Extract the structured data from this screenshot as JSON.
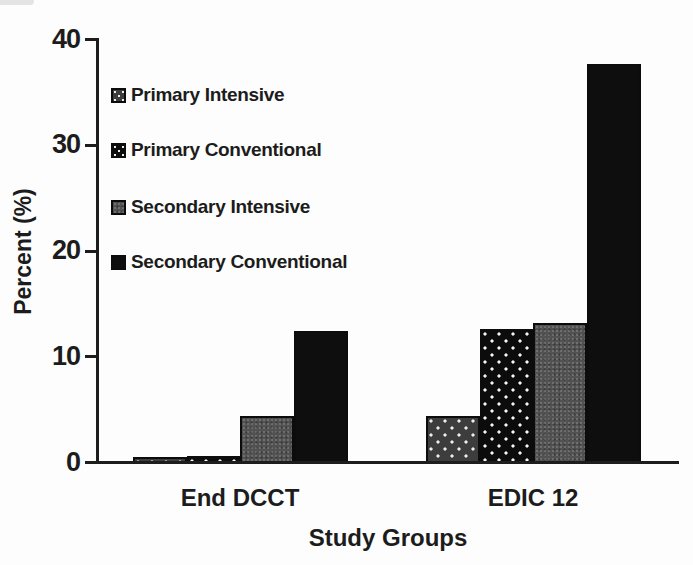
{
  "chart_data": {
    "type": "bar",
    "title": "",
    "xlabel": "Study Groups",
    "ylabel": "Percent (%)",
    "ylim": [
      0,
      40
    ],
    "yticks": [
      0,
      10,
      20,
      30,
      40
    ],
    "grid": false,
    "legend_position": "upper-left-inside",
    "categories": [
      "End DCCT",
      "EDIC 12"
    ],
    "series": [
      {
        "name": "Primary Intensive",
        "values": [
          0.6,
          4.4
        ],
        "fill": "#3d3d3d",
        "pattern": "white-dots-on-dark-gray"
      },
      {
        "name": "Primary Conventional",
        "values": [
          0.7,
          12.7
        ],
        "fill": "#0c0c0c",
        "pattern": "white-dots-on-black"
      },
      {
        "name": "Secondary Intensive",
        "values": [
          4.4,
          13.2
        ],
        "fill": "#525252",
        "pattern": "speckled-gray"
      },
      {
        "name": "Secondary Conventional",
        "values": [
          12.5,
          37.7
        ],
        "fill": "#0e0e0e",
        "pattern": "solid-black"
      }
    ]
  },
  "style": {
    "background": "#fdfdfd",
    "axis_color": "#1d1d1d",
    "text_color": "#1c1c1c"
  }
}
